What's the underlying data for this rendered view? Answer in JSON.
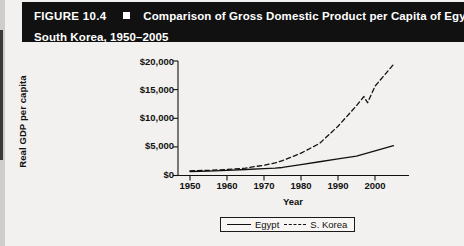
{
  "figure": {
    "number_label": "FIGURE 10.4",
    "bullet_icon": "square-marker",
    "title_line1": "Comparison of Gross Domestic Product per Capita of Egypt and",
    "title_line2": "South Korea, 1950–2005"
  },
  "legend": {
    "egypt_label": "Egypt",
    "korea_label": "S. Korea"
  },
  "chart_data": {
    "type": "line",
    "title": "Comparison of Gross Domestic Product per Capita of Egypt and South Korea, 1950–2005",
    "xlabel": "Year",
    "ylabel": "Real GDP per capita",
    "xlim": [
      1948,
      2007
    ],
    "ylim": [
      0,
      20000
    ],
    "xticks": [
      1950,
      1960,
      1970,
      1980,
      1990,
      2000
    ],
    "xtick_labels": [
      "1950",
      "1960",
      "1970",
      "1980",
      "1990",
      "2000"
    ],
    "yticks": [
      0,
      5000,
      10000,
      15000,
      20000
    ],
    "ytick_labels": [
      "$0",
      "$5,000",
      "$10,000",
      "$15,000",
      "$20,000"
    ],
    "grid": false,
    "legend_position": "bottom-center",
    "series": [
      {
        "name": "Egypt",
        "style": "solid",
        "color": "#111111",
        "x": [
          1950,
          1955,
          1960,
          1965,
          1970,
          1973,
          1975,
          1980,
          1985,
          1990,
          1995,
          2000,
          2005
        ],
        "values": [
          700,
          780,
          900,
          1050,
          1200,
          1280,
          1400,
          1900,
          2400,
          2900,
          3400,
          4300,
          5200
        ]
      },
      {
        "name": "S. Korea",
        "style": "dashed",
        "color": "#111111",
        "x": [
          1950,
          1955,
          1960,
          1965,
          1970,
          1973,
          1975,
          1980,
          1985,
          1990,
          1995,
          1997,
          1998,
          2000,
          2005
        ],
        "values": [
          820,
          900,
          1050,
          1300,
          1800,
          2200,
          2600,
          3900,
          5600,
          8600,
          12200,
          13800,
          12700,
          15600,
          19400
        ]
      }
    ],
    "annotations": [
      "S. Korea overtakes Egypt in the mid-1970s",
      "Sharp dip in S. Korea near 1998"
    ]
  }
}
